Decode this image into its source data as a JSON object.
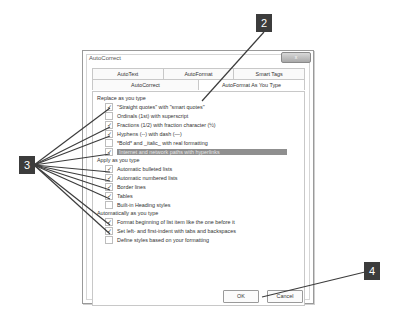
{
  "dialog": {
    "title": "AutoCorrect",
    "close_label": "x",
    "tabs_row1": [
      {
        "label": "AutoText",
        "active": false
      },
      {
        "label": "AutoFormat",
        "active": false
      },
      {
        "label": "Smart Tags",
        "active": false
      }
    ],
    "tabs_row2": [
      {
        "label": "AutoCorrect",
        "active": false
      },
      {
        "label": "AutoFormat As You Type",
        "active": true
      }
    ],
    "sections": [
      {
        "label": "Replace as you type"
      },
      {
        "label": "Apply as you type"
      },
      {
        "label": "Automatically as you type"
      }
    ],
    "options": [
      {
        "label": "\"Straight quotes\" with \"smart quotes\"",
        "checked": true
      },
      {
        "label": "Ordinals (1st) with superscript",
        "checked": false
      },
      {
        "label": "Fractions (1/2) with fraction character (½)",
        "checked": true
      },
      {
        "label": "Hyphens (--) with dash (—)",
        "checked": true
      },
      {
        "label": "*Bold* and _italic_ with real formatting",
        "checked": false
      },
      {
        "label": "Internet and network paths with hyperlinks",
        "checked": true,
        "highlighted": true
      },
      {
        "label": "Automatic bulleted lists",
        "checked": true
      },
      {
        "label": "Automatic numbered lists",
        "checked": true
      },
      {
        "label": "Border lines",
        "checked": true
      },
      {
        "label": "Tables",
        "checked": true
      },
      {
        "label": "Built-in Heading styles",
        "checked": false
      },
      {
        "label": "Format beginning of list item like the one before it",
        "checked": true
      },
      {
        "label": "Set left- and first-indent with tabs and backspaces",
        "checked": true
      },
      {
        "label": "Define styles based on your formatting",
        "checked": false
      }
    ],
    "ok_label": "OK",
    "cancel_label": "Cancel"
  },
  "callouts": [
    {
      "number": "2"
    },
    {
      "number": "3"
    },
    {
      "number": "4"
    }
  ],
  "check_glyph": "✓"
}
